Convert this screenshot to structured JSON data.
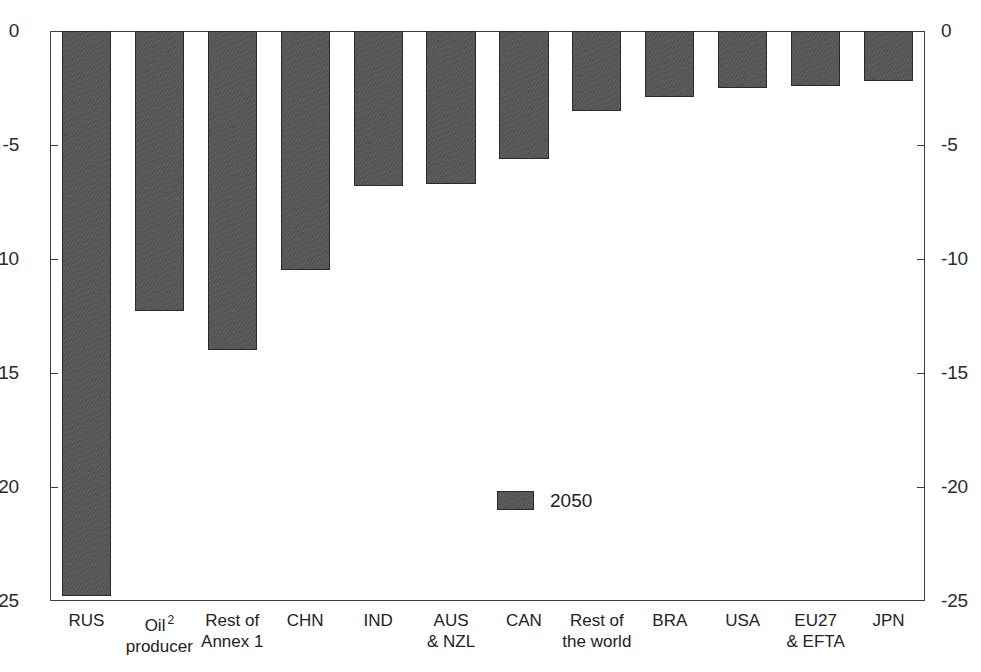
{
  "chart_data": {
    "type": "bar",
    "title": "",
    "subtitle": "",
    "xlabel": "",
    "ylabel": "",
    "ylim": [
      -25,
      0
    ],
    "grid": false,
    "orientation": "vertical",
    "legend_position": "inside-center",
    "dual_y_axis": true,
    "bar_color": "#565656",
    "categories": [
      "RUS",
      "Oil producer",
      "Rest of Annex 1",
      "CHN",
      "IND",
      "AUS & NZL",
      "CAN",
      "Rest of the world",
      "BRA",
      "USA",
      "EU27 & EFTA",
      "JPN"
    ],
    "category_lines": [
      {
        "line1": "RUS",
        "line2": "",
        "footnote": ""
      },
      {
        "line1": "Oil",
        "line2": "producer",
        "footnote": "2"
      },
      {
        "line1": "Rest of",
        "line2": "Annex 1",
        "footnote": ""
      },
      {
        "line1": "CHN",
        "line2": "",
        "footnote": ""
      },
      {
        "line1": "IND",
        "line2": "",
        "footnote": ""
      },
      {
        "line1": "AUS",
        "line2": "& NZL",
        "footnote": ""
      },
      {
        "line1": "CAN",
        "line2": "",
        "footnote": ""
      },
      {
        "line1": "Rest of",
        "line2": "the world",
        "footnote": ""
      },
      {
        "line1": "BRA",
        "line2": "",
        "footnote": ""
      },
      {
        "line1": "USA",
        "line2": "",
        "footnote": ""
      },
      {
        "line1": "EU27",
        "line2": "& EFTA",
        "footnote": ""
      },
      {
        "line1": "JPN",
        "line2": "",
        "footnote": ""
      }
    ],
    "series": [
      {
        "name": "2050",
        "values": [
          -24.8,
          -12.3,
          -14.0,
          -10.5,
          -6.8,
          -6.7,
          -5.6,
          -3.5,
          -2.9,
          -2.5,
          -2.4,
          -2.2
        ]
      }
    ],
    "yticks": [
      0,
      -5,
      -10,
      -15,
      -20,
      -25
    ],
    "ytick_labels_left": [
      "0",
      "-5",
      "-10",
      "-15",
      "-20",
      "-25"
    ],
    "ytick_labels_right": [
      "0",
      "-5",
      "-10",
      "-15",
      "-20",
      "-25"
    ],
    "legend": [
      {
        "label": "2050",
        "color": "#565656"
      }
    ]
  }
}
